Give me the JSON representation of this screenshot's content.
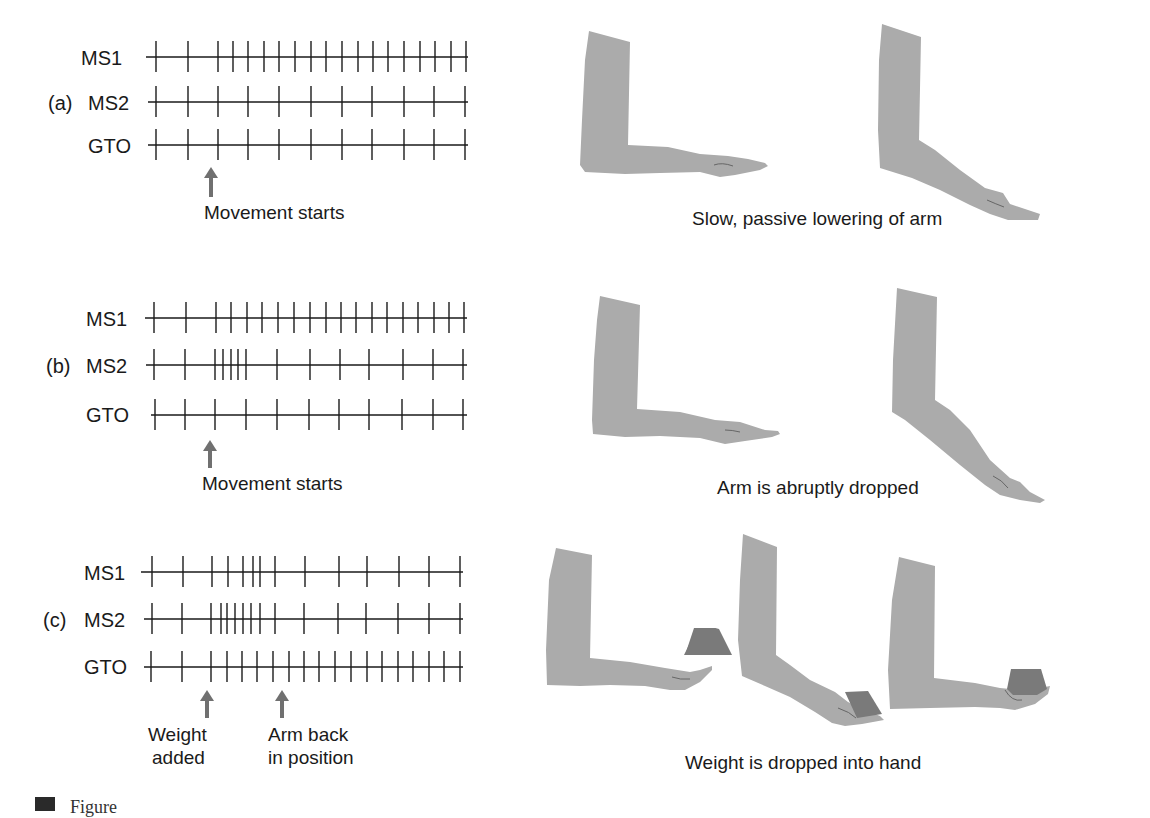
{
  "figure": {
    "label_visible": "Figure",
    "panels": [
      {
        "id": "a",
        "letter": "(a)",
        "rows": [
          {
            "name": "MS1",
            "y": 57,
            "line_x": [
              146,
              468
            ],
            "spikes": [
              156,
              188,
              218,
              233,
              248,
              264,
              279,
              295,
              311,
              326,
              342,
              358,
              373,
              388,
              404,
              420,
              435,
              451,
              466
            ]
          },
          {
            "name": "MS2",
            "y": 102,
            "line_x": [
              148,
              468
            ],
            "spikes": [
              156,
              188,
              218,
              248,
              279,
              311,
              342,
              372,
              404,
              434,
              465
            ]
          },
          {
            "name": "GTO",
            "y": 145,
            "line_x": [
              148,
              468
            ],
            "spikes": [
              156,
              188,
              218,
              248,
              279,
              311,
              342,
              372,
              404,
              434,
              465
            ]
          }
        ],
        "arrows": [
          {
            "x": 211,
            "y_top": 167,
            "y_bottom": 197,
            "label_lines": [
              "Movement starts"
            ],
            "label_x": 204,
            "label_y": 202
          }
        ],
        "caption": "Slow, passive lowering of arm",
        "caption_x": 692,
        "caption_y": 207
      },
      {
        "id": "b",
        "letter": "(b)",
        "rows": [
          {
            "name": "MS1",
            "y": 318,
            "line_x": [
              145,
              467
            ],
            "spikes": [
              154,
              186,
              216,
              231,
              247,
              262,
              278,
              294,
              310,
              326,
              341,
              356,
              372,
              387,
              403,
              418,
              434,
              449,
              464
            ]
          },
          {
            "name": "MS2",
            "y": 365,
            "line_x": [
              146,
              467
            ],
            "spikes": [
              154,
              185,
              215,
              223,
              231,
              238,
              246,
              277,
              310,
              340,
              369,
              403,
              433,
              463
            ]
          },
          {
            "name": "GTO",
            "y": 415,
            "line_x": [
              151,
              467
            ],
            "spikes": [
              155,
              185,
              215,
              246,
              277,
              309,
              339,
              369,
              402,
              433,
              463
            ]
          }
        ],
        "arrows": [
          {
            "x": 210,
            "y_top": 440,
            "y_bottom": 468,
            "label_lines": [
              "Movement starts"
            ],
            "label_x": 202,
            "label_y": 473
          }
        ],
        "caption": "Arm is abruptly dropped",
        "caption_x": 717,
        "caption_y": 476
      },
      {
        "id": "c",
        "letter": "(c)",
        "rows": [
          {
            "name": "MS1",
            "y": 572,
            "line_x": [
              141,
              463
            ],
            "spikes": [
              152,
              183,
              212,
              228,
              243,
              253,
              260,
              275,
              305,
              339,
              367,
              399,
              429,
              460
            ]
          },
          {
            "name": "MS2",
            "y": 619,
            "line_x": [
              144,
              463
            ],
            "spikes": [
              152,
              182,
              211,
              221,
              227,
              235,
              243,
              251,
              260,
              275,
              304,
              338,
              366,
              398,
              429,
              460
            ]
          },
          {
            "name": "GTO",
            "y": 667,
            "line_x": [
              144,
              463
            ],
            "spikes": [
              151,
              182,
              211,
              227,
              242,
              257,
              273,
              289,
              304,
              319,
              335,
              351,
              367,
              382,
              398,
              413,
              429,
              444,
              460
            ]
          }
        ],
        "arrows": [
          {
            "x": 207,
            "y_top": 690,
            "y_bottom": 718,
            "label_lines": [
              "Weight",
              "added"
            ],
            "label_x": 147,
            "label_y": 725
          },
          {
            "x": 282,
            "y_top": 690,
            "y_bottom": 718,
            "label_lines": [
              "Arm back",
              "in position"
            ],
            "label_x": 268,
            "label_y": 725
          }
        ],
        "caption": "Weight is dropped into hand",
        "caption_x": 685,
        "caption_y": 752
      }
    ],
    "colors": {
      "ink": "#1a1a1a",
      "arrow": "#707070",
      "arm": "#ababab",
      "weight": "#7a7a7a"
    }
  },
  "labels": {
    "a_letter": "(a)",
    "b_letter": "(b)",
    "c_letter": "(c)",
    "ms1": "MS1",
    "ms2": "MS2",
    "gto": "GTO",
    "a_arrow": "Movement starts",
    "b_arrow": "Movement starts",
    "c_arrow1_l1": "Weight",
    "c_arrow1_l2": "added",
    "c_arrow2_l1": "Arm back",
    "c_arrow2_l2": "in position",
    "a_caption": "Slow, passive lowering of arm",
    "b_caption": "Arm is abruptly dropped",
    "c_caption": "Weight is dropped into hand",
    "fig_label": "Figure"
  }
}
